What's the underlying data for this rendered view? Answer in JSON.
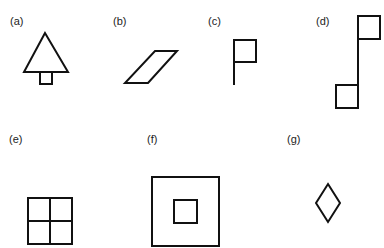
{
  "panels": [
    {
      "id": "a",
      "label": "(a)",
      "shape": "triangle-tree"
    },
    {
      "id": "b",
      "label": "(b)",
      "shape": "parallelogram"
    },
    {
      "id": "c",
      "label": "(c)",
      "shape": "flag"
    },
    {
      "id": "d",
      "label": "(d)",
      "shape": "pole-with-two-squares"
    },
    {
      "id": "e",
      "label": "(e)",
      "shape": "square-divided-into-four"
    },
    {
      "id": "f",
      "label": "(f)",
      "shape": "nested-squares"
    },
    {
      "id": "g",
      "label": "(g)",
      "shape": "diamond"
    }
  ],
  "colors": {
    "stroke": "#111111",
    "background": "#ffffff"
  }
}
